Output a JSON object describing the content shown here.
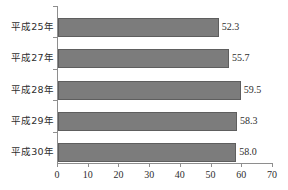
{
  "chart_data": {
    "type": "bar",
    "orientation": "horizontal",
    "title": "",
    "subtitle": "",
    "xlabel": "",
    "ylabel": "",
    "categories": [
      "平成25年",
      "平成27年",
      "平成28年",
      "平成29年",
      "平成30年"
    ],
    "values": [
      52.3,
      55.7,
      59.5,
      58.3,
      58.0
    ],
    "value_labels": [
      "52.3",
      "55.7",
      "59.5",
      "58.3",
      "58.0"
    ],
    "xlim": [
      0,
      70
    ],
    "xticks": [
      0,
      10,
      20,
      30,
      40,
      50,
      60,
      70
    ],
    "xtick_labels": [
      "0",
      "10",
      "20",
      "30",
      "40",
      "50",
      "60",
      "70"
    ],
    "grid": false,
    "legend": null,
    "colors": {
      "bar_fill": "#7c7c7c",
      "bar_stroke": "#5e5e5e",
      "axis": "#8e8e8e",
      "text": "#2e2e2e",
      "background": "#ffffff"
    }
  }
}
